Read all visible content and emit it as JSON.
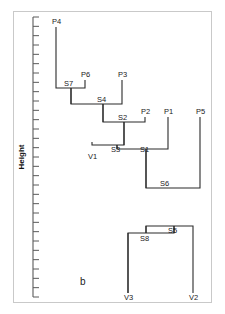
{
  "figure": {
    "panel_letter": "b",
    "axis_title": "Height",
    "background": "#ffffff",
    "line_color": "#2b2b2b",
    "axis_color": "#5a5a5a",
    "frame_color": "#c9c9c9"
  },
  "chart_data": {
    "type": "diagram",
    "subtype": "dendrogram",
    "title": "",
    "xlabel": "",
    "ylabel": "Height",
    "orientation": "vertical-hanging",
    "grid": false,
    "legend": false,
    "axis": {
      "title": "Height",
      "ticks_labeled": false,
      "tick_count": 31,
      "tick_top_px": 17,
      "tick_bottom_px": 297,
      "axis_x_px": 33
    },
    "leaves": [
      {
        "id": "P4",
        "label": "P4",
        "x": 56,
        "label_x": 52,
        "label_y": 24,
        "top_y": 27,
        "parent": "S7"
      },
      {
        "id": "P6",
        "label": "P6",
        "x": 85,
        "label_x": 81,
        "label_y": 77,
        "top_y": 80,
        "parent": "S7"
      },
      {
        "id": "P3",
        "label": "P3",
        "x": 122,
        "label_x": 118,
        "label_y": 77,
        "top_y": 80,
        "parent": "S4"
      },
      {
        "id": "P2",
        "label": "P2",
        "x": 145,
        "label_x": 141,
        "label_y": 114,
        "top_y": 117,
        "parent": "S2"
      },
      {
        "id": "P1",
        "label": "P1",
        "x": 168,
        "label_x": 164,
        "label_y": 114,
        "top_y": 117,
        "parent": "S1"
      },
      {
        "id": "P5",
        "label": "P5",
        "x": 200,
        "label_x": 196,
        "label_y": 114,
        "top_y": 117,
        "parent": "S6"
      },
      {
        "id": "V1",
        "label": "V1",
        "x": 92,
        "label_x": 88,
        "label_y": 159,
        "top_y": 142,
        "parent": "S3"
      },
      {
        "id": "V3",
        "label": "V3",
        "x": 128,
        "label_x": 124,
        "label_y": 300,
        "top_y": 233,
        "parent": "S8"
      },
      {
        "id": "V2",
        "label": "V2",
        "x": 193,
        "label_x": 189,
        "label_y": 300,
        "top_y": 233,
        "parent": "S5"
      }
    ],
    "internal_nodes": [
      {
        "id": "S7",
        "label": "S7",
        "x": 71,
        "height_y": 88,
        "label_x": 64,
        "label_y": 86,
        "children": [
          "P4",
          "P6"
        ]
      },
      {
        "id": "S4",
        "label": "S4",
        "x": 103,
        "height_y": 104,
        "label_x": 97,
        "label_y": 102,
        "children": [
          "S7",
          "P3"
        ]
      },
      {
        "id": "S2",
        "label": "S2",
        "x": 124,
        "height_y": 122,
        "label_x": 118,
        "label_y": 120,
        "children": [
          "S4",
          "P2"
        ]
      },
      {
        "id": "S3",
        "label": "S3",
        "x": 117,
        "height_y": 145,
        "label_x": 111,
        "label_y": 152,
        "children": [
          "V1",
          "S2"
        ]
      },
      {
        "id": "S1",
        "label": "S1",
        "x": 146,
        "height_y": 149,
        "label_x": 140,
        "label_y": 152,
        "children": [
          "S3",
          "P1"
        ]
      },
      {
        "id": "S6",
        "label": "S6",
        "x": 167,
        "height_y": 188,
        "label_x": 160,
        "label_y": 186,
        "children": [
          "S1",
          "P5"
        ]
      },
      {
        "id": "S5",
        "label": "S5",
        "x": 174,
        "height_y": 226,
        "label_x": 168,
        "label_y": 233,
        "children": [
          "S8",
          "V2"
        ]
      },
      {
        "id": "S8",
        "label": "S8",
        "x": 146,
        "height_y": 233,
        "label_x": 140,
        "label_y": 241,
        "children": [
          "V3",
          "S5"
        ]
      }
    ],
    "merges": [
      {
        "node": "S7",
        "left_x": 56,
        "right_x": 85,
        "y": 88,
        "left_from_y": 27,
        "right_from_y": 80
      },
      {
        "node": "S4",
        "left_x": 71,
        "right_x": 122,
        "y": 104,
        "left_from_y": 88,
        "right_from_y": 80
      },
      {
        "node": "S2",
        "left_x": 103,
        "right_x": 145,
        "y": 122,
        "left_from_y": 104,
        "right_from_y": 117
      },
      {
        "node": "S3",
        "left_x": 92,
        "right_x": 124,
        "y": 145,
        "left_from_y": 142,
        "right_from_y": 122
      },
      {
        "node": "S1",
        "left_x": 117,
        "right_x": 168,
        "y": 149,
        "left_from_y": 145,
        "right_from_y": 117
      },
      {
        "node": "S6",
        "left_x": 146,
        "right_x": 200,
        "y": 188,
        "left_from_y": 149,
        "right_from_y": 117
      },
      {
        "node": "S5",
        "left_x": 146,
        "right_x": 193,
        "y": 226,
        "left_from_y": 233,
        "right_from_y": 233
      },
      {
        "node": "S8",
        "left_x": 128,
        "right_x": 174,
        "y": 233,
        "left_from_y": 293,
        "right_from_y": 226
      }
    ]
  }
}
